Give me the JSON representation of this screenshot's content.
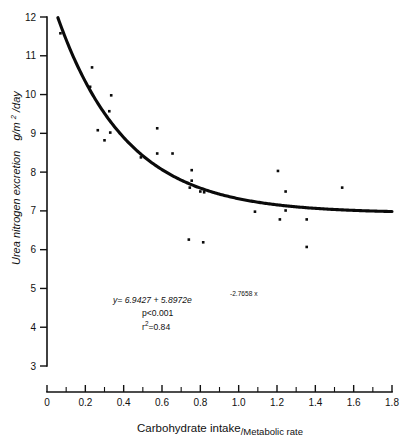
{
  "figure": {
    "background_color": "#ffffff",
    "ink_color": "#0a0a0a"
  },
  "chart_data": {
    "type": "scatter",
    "title": "",
    "subtitle": "",
    "xlabel": "Carbohydrate intake/Metabolic rate",
    "xlabel_numerator": "Carbohydrate intake",
    "xlabel_separator": "/",
    "xlabel_denominator": "Metabolic rate",
    "ylabel": "Urea nitrogen excretion  g/m2/day",
    "ylabel_text": "Urea nitrogen excretion",
    "ylabel_units_base": "g/m",
    "ylabel_units_exp": "2",
    "ylabel_units_tail": "/day",
    "xlim": [
      0,
      1.8
    ],
    "ylim": [
      3,
      12
    ],
    "grid": false,
    "legend": "none",
    "x_ticks_major": [
      0,
      0.2,
      0.4,
      0.6,
      0.8,
      1.0,
      1.2,
      1.4,
      1.6,
      1.8
    ],
    "x_tick_labels": [
      "0",
      "0.2",
      "0.4",
      "0.6",
      "0.8",
      "1.0",
      "1.2",
      "1.4",
      "1.6",
      "1.8"
    ],
    "x_ticks_minor": [
      0.1,
      0.3,
      0.5,
      0.7,
      0.9,
      1.1,
      1.3,
      1.5,
      1.7
    ],
    "y_ticks_major": [
      3,
      4,
      5,
      6,
      7,
      8,
      9,
      10,
      11,
      12
    ],
    "y_tick_labels": [
      "3",
      "4",
      "5",
      "6",
      "7",
      "8",
      "9",
      "10",
      "11",
      "12"
    ],
    "marker": "square-dot",
    "marker_size_px": 2.6,
    "points": [
      {
        "x": 0.07,
        "y": 11.58
      },
      {
        "x": 0.235,
        "y": 10.7
      },
      {
        "x": 0.225,
        "y": 10.2
      },
      {
        "x": 0.335,
        "y": 9.98
      },
      {
        "x": 0.325,
        "y": 9.57
      },
      {
        "x": 0.265,
        "y": 9.08
      },
      {
        "x": 0.33,
        "y": 9.02
      },
      {
        "x": 0.3,
        "y": 8.82
      },
      {
        "x": 0.575,
        "y": 9.13
      },
      {
        "x": 0.49,
        "y": 8.38
      },
      {
        "x": 0.575,
        "y": 8.48
      },
      {
        "x": 0.655,
        "y": 8.48
      },
      {
        "x": 0.755,
        "y": 8.05
      },
      {
        "x": 0.755,
        "y": 7.78
      },
      {
        "x": 0.745,
        "y": 7.6
      },
      {
        "x": 0.8,
        "y": 7.5
      },
      {
        "x": 0.82,
        "y": 7.48
      },
      {
        "x": 0.74,
        "y": 6.26
      },
      {
        "x": 0.815,
        "y": 6.19
      },
      {
        "x": 1.085,
        "y": 6.98
      },
      {
        "x": 1.205,
        "y": 8.03
      },
      {
        "x": 1.245,
        "y": 7.5
      },
      {
        "x": 1.245,
        "y": 7.01
      },
      {
        "x": 1.215,
        "y": 6.78
      },
      {
        "x": 1.355,
        "y": 6.78
      },
      {
        "x": 1.355,
        "y": 6.07
      },
      {
        "x": 1.54,
        "y": 7.6
      }
    ],
    "fit_curve": {
      "model": "exponential_decay",
      "equation_text": "y= 6.9427 + 5.8972e",
      "equation_exponent": "-2.7658 x",
      "intercept": 6.9427,
      "amplitude": 5.8972,
      "rate": -2.7658,
      "x_start": 0.05,
      "x_end": 1.8
    },
    "annotations": {
      "equation_main": "y= 6.9427 + 5.8972e",
      "equation_exponent": "-2.7658 x",
      "p_value": "p<0.001",
      "r_squared_base": "r",
      "r_squared_exp": "2",
      "r_squared_value": "=0.84"
    }
  }
}
